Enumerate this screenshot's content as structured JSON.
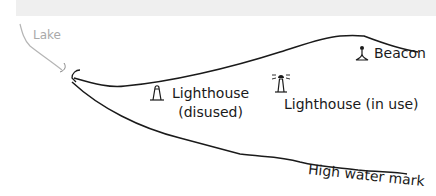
{
  "header": {
    "title": ""
  },
  "map": {
    "labels": {
      "lake": "Lake",
      "beacon": "Beacon",
      "lighthouse_disused_line1": "Lighthouse",
      "lighthouse_disused_line2": "(disused)",
      "lighthouse_in_use": "Lighthouse (in use)",
      "high_water_mark": "High water mark"
    },
    "symbols": [
      {
        "name": "beacon-icon",
        "label": "Beacon"
      },
      {
        "name": "lighthouse-disused-icon",
        "label": "Lighthouse (disused)"
      },
      {
        "name": "lighthouse-in-use-icon",
        "label": "Lighthouse (in use)"
      }
    ],
    "colors": {
      "line": "#1a1a1a",
      "lake_line": "#b5b5b5",
      "top_band": "#efefef"
    }
  }
}
